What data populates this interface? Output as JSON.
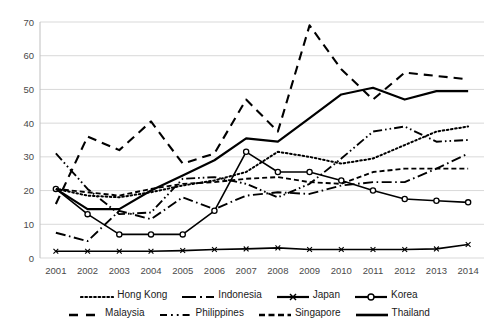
{
  "chart_data": {
    "type": "line",
    "title": "",
    "xlabel": "",
    "ylabel": "",
    "x": [
      2001,
      2002,
      2003,
      2004,
      2005,
      2006,
      2007,
      2008,
      2009,
      2010,
      2011,
      2012,
      2013,
      2014
    ],
    "categories": [
      "2001",
      "2002",
      "2003",
      "2004",
      "2005",
      "2006",
      "2007",
      "2008",
      "2009",
      "2010",
      "2011",
      "2012",
      "2013",
      "2014"
    ],
    "ylim": [
      0,
      70
    ],
    "yticks": [
      0,
      10,
      20,
      30,
      40,
      50,
      60,
      70
    ],
    "ytick_labels": [
      "0",
      "10",
      "20",
      "30",
      "40",
      "50",
      "60",
      "70"
    ],
    "grid": true,
    "grid_axis": "y",
    "legend_position": "bottom",
    "series": [
      {
        "name": "Hong Kong",
        "style": "dotted",
        "marker": "none",
        "values": [
          20.5,
          18.5,
          18.0,
          19.5,
          21.5,
          23.0,
          25.5,
          31.5,
          30.0,
          28.0,
          29.5,
          33.5,
          37.5,
          39.0
        ]
      },
      {
        "name": "Indonesia",
        "style": "dash-dot",
        "marker": "none",
        "values": [
          7.5,
          5.0,
          14.0,
          11.5,
          18.0,
          14.5,
          18.5,
          19.5,
          19.0,
          21.5,
          22.5,
          22.5,
          26.5,
          31.0
        ]
      },
      {
        "name": "Japan",
        "style": "solid",
        "marker": "cross",
        "values": [
          2.0,
          2.0,
          2.0,
          2.0,
          2.2,
          2.5,
          2.7,
          3.0,
          2.5,
          2.5,
          2.5,
          2.5,
          2.7,
          4.0
        ]
      },
      {
        "name": "Korea",
        "style": "solid",
        "marker": "circle",
        "values": [
          20.5,
          13.0,
          7.0,
          7.0,
          7.0,
          14.0,
          31.5,
          25.5,
          25.5,
          23.0,
          20.0,
          17.5,
          17.0,
          16.5
        ]
      },
      {
        "name": "Malaysia",
        "style": "long-dash",
        "marker": "none",
        "values": [
          16.0,
          36.0,
          32.0,
          40.5,
          28.0,
          31.0,
          47.0,
          37.5,
          69.0,
          56.0,
          47.0,
          55.0,
          54.0,
          53.0
        ]
      },
      {
        "name": "Philippines",
        "style": "dash-dot-dot",
        "marker": "none",
        "values": [
          31.0,
          20.5,
          13.0,
          13.5,
          23.5,
          24.0,
          22.0,
          18.0,
          22.0,
          29.5,
          37.5,
          39.0,
          34.5,
          35.0
        ]
      },
      {
        "name": "Singapore",
        "style": "dashed",
        "marker": "none",
        "values": [
          20.5,
          19.5,
          18.5,
          20.5,
          22.0,
          22.5,
          23.5,
          24.0,
          22.5,
          22.0,
          25.5,
          26.5,
          26.5,
          26.5
        ]
      },
      {
        "name": "Thailand",
        "style": "solid-thick",
        "marker": "none",
        "values": [
          20.5,
          14.5,
          14.5,
          20.0,
          24.5,
          29.0,
          35.5,
          34.5,
          41.5,
          48.5,
          50.5,
          47.0,
          49.5,
          49.5
        ]
      }
    ]
  },
  "legend": {
    "items": [
      {
        "label": "Hong Kong",
        "key": "dotted"
      },
      {
        "label": "Indonesia",
        "key": "dash-dot"
      },
      {
        "label": "Japan",
        "key": "solid-marker-cross"
      },
      {
        "label": "Korea",
        "key": "solid-marker-circle"
      },
      {
        "label": "Malaysia",
        "key": "long-dash"
      },
      {
        "label": "Philippines",
        "key": "dash-dot-dot"
      },
      {
        "label": "Singapore",
        "key": "dashed"
      },
      {
        "label": "Thailand",
        "key": "solid-thick"
      }
    ]
  },
  "colors": {
    "line": "#000000",
    "grid": "#d9d9d9",
    "axis": "#bfbfbf",
    "tick_text": "#4a4a4a"
  }
}
